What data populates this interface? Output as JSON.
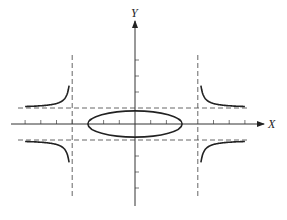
{
  "diagram": {
    "type": "curve-plot",
    "axes": {
      "x_label": "X",
      "y_label": "Y"
    },
    "ticks": {
      "x": [
        -7,
        -6,
        -5,
        -4,
        -2,
        -1,
        1,
        2,
        5,
        6,
        7
      ],
      "y": [
        -4,
        -3,
        -2,
        2,
        3,
        4
      ]
    },
    "asymptotes": {
      "vertical": [
        -4,
        4
      ],
      "horizontal": [
        -1,
        1
      ]
    },
    "ellipse": {
      "a": 3,
      "b": 0.82
    },
    "hyperbola_branches": [
      {
        "quadrant": "upper-left",
        "x_range": [
          -7,
          -4.2
        ]
      },
      {
        "quadrant": "upper-right",
        "x_range": [
          4.2,
          7
        ]
      },
      {
        "quadrant": "lower-left",
        "x_range": [
          -7,
          -4.2
        ]
      },
      {
        "quadrant": "lower-right",
        "x_range": [
          4.2,
          7
        ]
      }
    ],
    "colors": {
      "curve": "#222222",
      "axis": "#333333",
      "dash": "#555555"
    }
  }
}
